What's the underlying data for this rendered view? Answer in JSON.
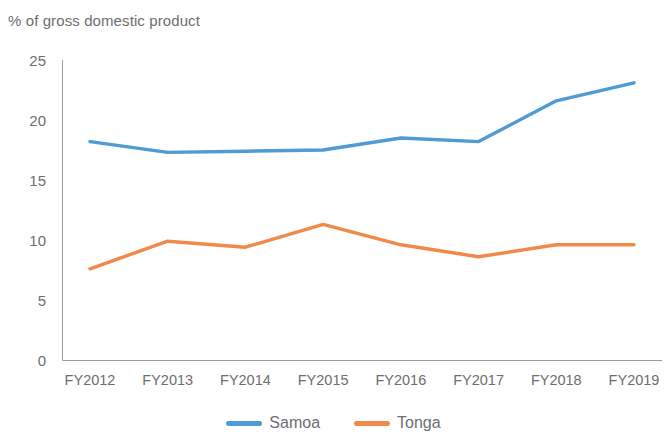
{
  "chart_data": {
    "type": "line",
    "title": "% of gross domestic product",
    "xlabel": "",
    "ylabel": "% of gross domestic product",
    "categories": [
      "FY2012",
      "FY2013",
      "FY2014",
      "FY2015",
      "FY2016",
      "FY2017",
      "FY2018",
      "FY2019"
    ],
    "series": [
      {
        "name": "Samoa",
        "color": "#4E9BD5",
        "values": [
          18.2,
          17.3,
          17.4,
          17.5,
          18.5,
          18.2,
          21.6,
          23.1
        ]
      },
      {
        "name": "Tonga",
        "color": "#F08A4B",
        "values": [
          7.6,
          9.9,
          9.4,
          11.3,
          9.6,
          8.6,
          9.6,
          9.6
        ]
      }
    ],
    "ylim": [
      0,
      25
    ],
    "y_ticks": [
      0,
      5,
      10,
      15,
      20,
      25
    ],
    "y_tick_labels": [
      "0",
      "5",
      "10",
      "15",
      "20",
      "25"
    ],
    "grid": false,
    "legend_position": "bottom"
  },
  "legend": {
    "entries": [
      {
        "label": "Samoa"
      },
      {
        "label": "Tonga"
      }
    ]
  },
  "axis": {
    "title": "% of gross domestic product"
  },
  "colors": {
    "samoa": "#4E9BD5",
    "tonga": "#F08A4B",
    "axis": "#9a9b9d",
    "text": "#6d6e70"
  }
}
